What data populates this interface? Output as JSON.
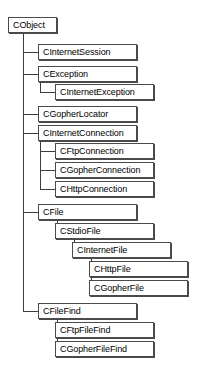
{
  "diagram": {
    "type": "class-hierarchy-tree",
    "root": "CObject",
    "colors": {
      "background": "#ffffff",
      "box_fill": "#ffffff",
      "box_border": "#4a4a4a",
      "connector": "#3c3c3c",
      "text": "#000000"
    },
    "nodes": {
      "cobject": {
        "label": "CObject",
        "level": 0,
        "x": 8,
        "y": 17,
        "w": 49
      },
      "cinternetsession": {
        "label": "CInternetSession",
        "level": 1,
        "x": 38,
        "y": 44,
        "w": 99
      },
      "cexception": {
        "label": "CException",
        "level": 1,
        "x": 38,
        "y": 66,
        "w": 99
      },
      "cinternetexception": {
        "label": "CInternetException",
        "level": 2,
        "x": 55,
        "y": 84,
        "w": 99
      },
      "cgopherlocator": {
        "label": "CGopherLocator",
        "level": 1,
        "x": 38,
        "y": 106,
        "w": 99
      },
      "cinternetconnection": {
        "label": "CInternetConnection",
        "level": 1,
        "x": 38,
        "y": 125,
        "w": 99
      },
      "cftpconnection": {
        "label": "CFtpConnection",
        "level": 2,
        "x": 55,
        "y": 143,
        "w": 99
      },
      "cgopherconnection": {
        "label": "CGopherConnection",
        "level": 2,
        "x": 55,
        "y": 162,
        "w": 99
      },
      "chttpconnection": {
        "label": "CHttpConnection",
        "level": 2,
        "x": 55,
        "y": 181,
        "w": 99
      },
      "cfile": {
        "label": "CFile",
        "level": 1,
        "x": 38,
        "y": 204,
        "w": 99
      },
      "cstdiofile": {
        "label": "CStdioFile",
        "level": 2,
        "x": 55,
        "y": 223,
        "w": 99
      },
      "cinternetfile": {
        "label": "CInternetFile",
        "level": 3,
        "x": 72,
        "y": 242,
        "w": 99
      },
      "chttpfile": {
        "label": "CHttpFile",
        "level": 4,
        "x": 89,
        "y": 261,
        "w": 99
      },
      "cgopherfile": {
        "label": "CGopherFile",
        "level": 4,
        "x": 89,
        "y": 280,
        "w": 99
      },
      "cfilefind": {
        "label": "CFileFind",
        "level": 1,
        "x": 38,
        "y": 303,
        "w": 99
      },
      "cftpfilefind": {
        "label": "CFtpFileFind",
        "level": 2,
        "x": 55,
        "y": 322,
        "w": 99
      },
      "cgopherfilefind": {
        "label": "CGopherFileFind",
        "level": 2,
        "x": 55,
        "y": 341,
        "w": 99
      }
    },
    "edges": [
      {
        "from": "cobject",
        "to": "cinternetsession"
      },
      {
        "from": "cobject",
        "to": "cexception"
      },
      {
        "from": "cexception",
        "to": "cinternetexception"
      },
      {
        "from": "cobject",
        "to": "cgopherlocator"
      },
      {
        "from": "cobject",
        "to": "cinternetconnection"
      },
      {
        "from": "cinternetconnection",
        "to": "cftpconnection"
      },
      {
        "from": "cinternetconnection",
        "to": "cgopherconnection"
      },
      {
        "from": "cinternetconnection",
        "to": "chttpconnection"
      },
      {
        "from": "cobject",
        "to": "cfile"
      },
      {
        "from": "cfile",
        "to": "cstdiofile"
      },
      {
        "from": "cstdiofile",
        "to": "cinternetfile"
      },
      {
        "from": "cinternetfile",
        "to": "chttpfile"
      },
      {
        "from": "cinternetfile",
        "to": "cgopherfile"
      },
      {
        "from": "cobject",
        "to": "cfilefind"
      },
      {
        "from": "cfilefind",
        "to": "cftpfilefind"
      },
      {
        "from": "cfilefind",
        "to": "cgopherfilefind"
      }
    ]
  }
}
